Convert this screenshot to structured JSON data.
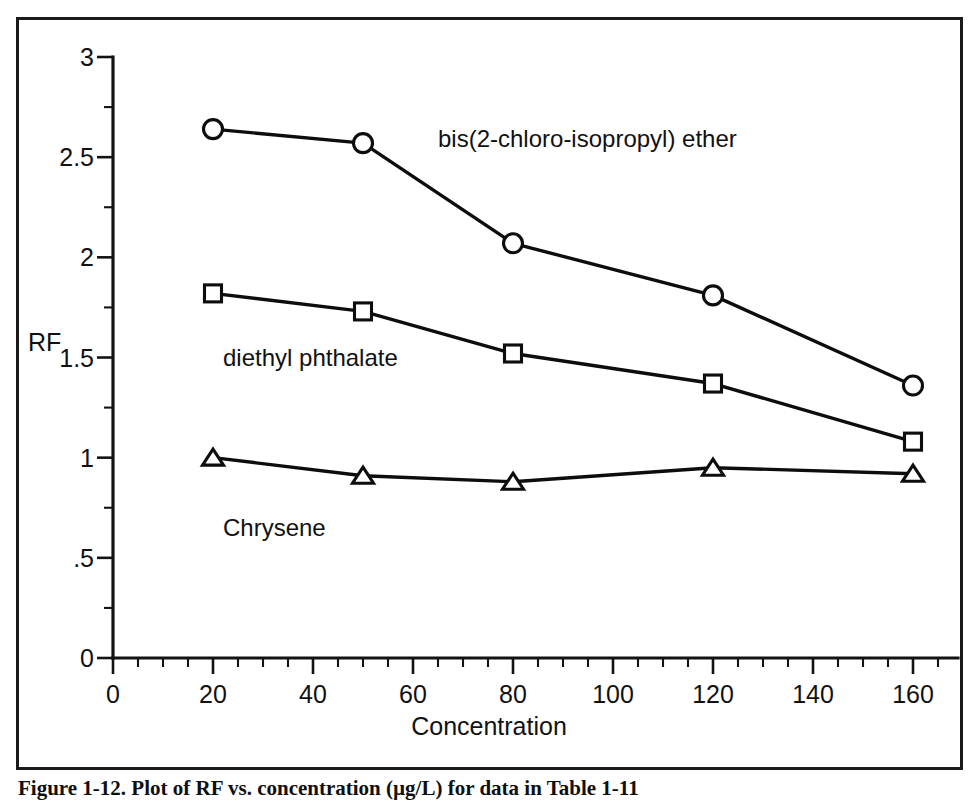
{
  "chart_data": {
    "type": "line",
    "title": "",
    "xlabel": "Concentration",
    "ylabel": "RF",
    "x": [
      20,
      50,
      80,
      120,
      160
    ],
    "xlim": [
      0,
      169
    ],
    "ylim": [
      0,
      3
    ],
    "grid": false,
    "legend_position": "inline-annotations",
    "x_ticks": [
      0,
      20,
      40,
      60,
      80,
      100,
      120,
      140,
      160
    ],
    "x_tick_labels": [
      "0",
      "20",
      "40",
      "60",
      "80",
      "100",
      "120",
      "140",
      "160"
    ],
    "x_minor_tick_step": 5,
    "y_ticks": [
      0,
      0.5,
      1,
      1.5,
      2,
      2.5,
      3
    ],
    "y_tick_labels": [
      "0",
      ".5",
      "1",
      "1.5",
      "2",
      "2.5",
      "3"
    ],
    "y_minor_tick_step": 0.25,
    "series": [
      {
        "name": "bis(2-chloro-isopropyl) ether",
        "marker": "circle",
        "values": [
          2.64,
          2.57,
          2.07,
          1.81,
          1.36
        ]
      },
      {
        "name": "diethyl phthalate",
        "marker": "square",
        "values": [
          1.82,
          1.73,
          1.52,
          1.37,
          1.08
        ]
      },
      {
        "name": "Chrysene",
        "marker": "triangle",
        "values": [
          1.0,
          0.91,
          0.88,
          0.95,
          0.92
        ]
      }
    ],
    "annotations": [
      {
        "text": "bis(2-chloro-isopropyl) ether",
        "x": 65,
        "y": 2.59
      },
      {
        "text": "diethyl phthalate",
        "x": 22,
        "y": 1.5
      },
      {
        "text": "Chrysene",
        "x": 22,
        "y": 0.65
      }
    ]
  },
  "caption": {
    "text": "Figure 1-12.  Plot of RF vs. concentration (µg/L) for data in Table 1-11"
  },
  "colors": {
    "ink": "#111111",
    "background": "#ffffff",
    "marker_fill": "#ffffff"
  }
}
